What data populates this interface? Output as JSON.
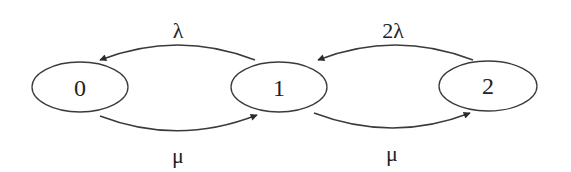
{
  "diagram": {
    "type": "state-transition",
    "colors": {
      "stroke": "#3a3a3a",
      "text": "#222222",
      "background": "#ffffff"
    },
    "states": [
      {
        "id": "0",
        "label": "0"
      },
      {
        "id": "1",
        "label": "1"
      },
      {
        "id": "2",
        "label": "2"
      }
    ],
    "transitions": [
      {
        "from": "1",
        "to": "0",
        "label": "λ",
        "position": "top"
      },
      {
        "from": "0",
        "to": "1",
        "label": "μ",
        "position": "bottom"
      },
      {
        "from": "2",
        "to": "1",
        "label": "2λ",
        "position": "top"
      },
      {
        "from": "1",
        "to": "2",
        "label": "μ",
        "position": "bottom"
      }
    ]
  }
}
